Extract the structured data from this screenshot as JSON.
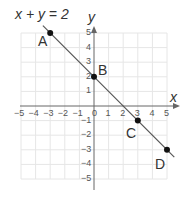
{
  "chart_data": {
    "type": "line",
    "title": "x + y = 2",
    "xlabel": "x",
    "ylabel": "y",
    "xlim": [
      -5,
      5
    ],
    "ylim": [
      -5,
      5
    ],
    "grid": true,
    "x_ticks": [
      "-5",
      "-4",
      "-3",
      "-2",
      "-1",
      "0",
      "1",
      "2",
      "3",
      "4",
      "5"
    ],
    "y_ticks": [
      "5",
      "4",
      "3",
      "2",
      "1",
      "-1",
      "-2",
      "-3",
      "-4",
      "-5"
    ],
    "series": [
      {
        "name": "x + y = 2",
        "x": [
          -3.5,
          5.5
        ],
        "y": [
          5.5,
          -3.5
        ]
      }
    ],
    "points": [
      {
        "label": "A",
        "x": -3,
        "y": 5
      },
      {
        "label": "B",
        "x": 0,
        "y": 2
      },
      {
        "label": "C",
        "x": 3,
        "y": -1
      },
      {
        "label": "D",
        "x": 5,
        "y": -3
      }
    ],
    "colors": {
      "line": "#555555",
      "grid": "#e6e6e6",
      "axis": "#666666",
      "point": "#111111"
    }
  },
  "labels": {
    "equation": "x + y = 2",
    "x_axis": "x",
    "y_axis": "y",
    "A": "A",
    "B": "B",
    "C": "C",
    "D": "D",
    "x_ticks": [
      "-5",
      "-4",
      "-3",
      "-2",
      "-1",
      "0",
      "1",
      "2",
      "3",
      "4",
      "5"
    ],
    "y_ticks": [
      "5",
      "4",
      "3",
      "2",
      "1",
      "-1",
      "-2",
      "-3",
      "-4",
      "-5"
    ]
  }
}
